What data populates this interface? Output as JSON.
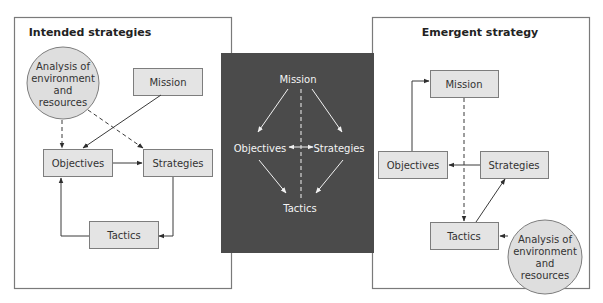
{
  "left_panel": {
    "title": "Intended strategies",
    "circle": [
      "Analysis of",
      "environment",
      "and",
      "resources"
    ],
    "mission": "Mission",
    "objectives": "Objectives",
    "strategies": "Strategies",
    "tactics": "Tactics"
  },
  "center_panel": {
    "mission": "Mission",
    "objectives": "Objectives",
    "strategies": "Strategies",
    "tactics": "Tactics",
    "background_color": "#4b4b4b"
  },
  "right_panel": {
    "title": "Emergent strategy",
    "circle": [
      "Analysis of",
      "environment",
      "and",
      "resources"
    ],
    "mission": "Mission",
    "objectives": "Objectives",
    "strategies": "Strategies",
    "tactics": "Tactics"
  },
  "colors": {
    "box_fill": "#e4e4e4",
    "circle_fill": "#dedede",
    "center_bg": "#4b4b4b"
  }
}
